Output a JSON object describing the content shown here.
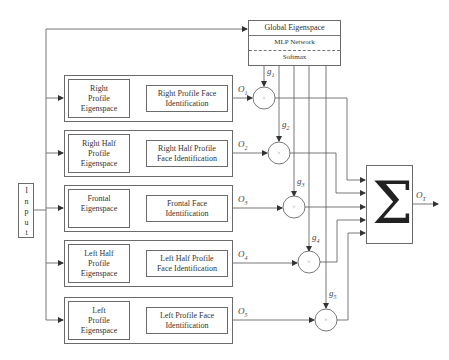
{
  "diagram": {
    "input": {
      "label": "Input",
      "letters": [
        "I",
        "n",
        "p",
        "u",
        "t"
      ]
    },
    "global": {
      "title": "Global Eigenspace",
      "network": "MLP Network",
      "output_layer": "Softmax"
    },
    "rows": [
      {
        "eigenspace": "Right Profile Eigenspace",
        "eig_lines": [
          "Right",
          "Profile",
          "Eigenspace"
        ],
        "identification": "Right Profile Face Identification",
        "id_lines": [
          "Right Profile Face",
          "Identification"
        ],
        "output": "O",
        "output_sub": "1",
        "gate": "g",
        "gate_sub": "1"
      },
      {
        "eigenspace": "Right Half Profile Eigenspace",
        "eig_lines": [
          "Right Half",
          "Profile",
          "Eigenspace"
        ],
        "identification": "Right Half Profile Face Identification",
        "id_lines": [
          "Right Half Profile",
          "Face Identification"
        ],
        "output": "O",
        "output_sub": "2",
        "gate": "g",
        "gate_sub": "2"
      },
      {
        "eigenspace": "Frontal Eigenspace",
        "eig_lines": [
          "Frontal",
          "Eigenspace",
          ""
        ],
        "identification": "Frontal Face Identification",
        "id_lines": [
          "Frontal Face",
          "Identification"
        ],
        "output": "O",
        "output_sub": "3",
        "gate": "g",
        "gate_sub": "3"
      },
      {
        "eigenspace": "Left Half Profile Eigenspace",
        "eig_lines": [
          "Left Half",
          "Profile",
          "Eigenspace"
        ],
        "identification": "Left Half Profile Face Identification",
        "id_lines": [
          "Left Half Profile",
          "Face Identification"
        ],
        "output": "O",
        "output_sub": "4",
        "gate": "g",
        "gate_sub": "4"
      },
      {
        "eigenspace": "Left Profile Eigenspace",
        "eig_lines": [
          "Left",
          "Profile",
          "Eigenspace"
        ],
        "identification": "Left Profile Face Identification",
        "id_lines": [
          "Left Profile Face",
          "Identification"
        ],
        "output": "O",
        "output_sub": "5",
        "gate": "g",
        "gate_sub": "5"
      }
    ],
    "multiplier_symbol": "×",
    "summation": {
      "symbol": "Σ",
      "output": "O",
      "output_sub": "T"
    }
  }
}
